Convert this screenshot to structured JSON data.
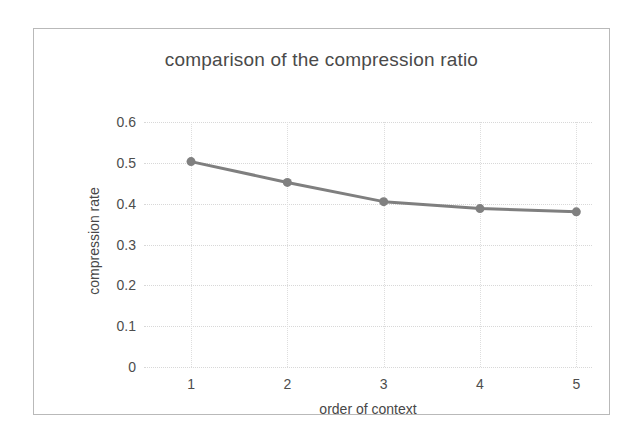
{
  "figure": {
    "background_color": "#ffffff",
    "border_color": "#b9b9b9"
  },
  "chart_data": {
    "type": "line",
    "title": "comparison of the compression ratio",
    "xlabel": "order of context",
    "ylabel": "compression rate",
    "categories": [
      "1",
      "2",
      "3",
      "4",
      "5"
    ],
    "x": [
      1,
      2,
      3,
      4,
      5
    ],
    "values": [
      0.503,
      0.452,
      0.405,
      0.388,
      0.38
    ],
    "series": [
      {
        "name": "compression rate",
        "values": [
          0.503,
          0.452,
          0.405,
          0.388,
          0.38
        ]
      }
    ],
    "ylim": [
      0,
      0.6
    ],
    "ytick_labels": [
      "0",
      "0.1",
      "0.2",
      "0.3",
      "0.4",
      "0.5",
      "0.6"
    ],
    "ytick_values": [
      0,
      0.1,
      0.2,
      0.3,
      0.4,
      0.5,
      0.6
    ],
    "xtick_labels": [
      "1",
      "2",
      "3",
      "4",
      "5"
    ],
    "grid": true,
    "grid_color": "#d8d8d8",
    "legend": false,
    "legend_position": "none",
    "line_color": "#7f7f7f",
    "marker_color": "#808080",
    "marker": "circle",
    "line_width": 3,
    "marker_size": 8
  }
}
